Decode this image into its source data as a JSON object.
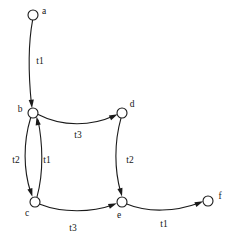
{
  "figure": {
    "kind": "directed-graph",
    "background_color": "#ffffff",
    "stroke_color": "#1a1a1a",
    "text_color": "#151515",
    "width": 237,
    "height": 244
  },
  "nodes": [
    {
      "id": "a",
      "label": "a",
      "cx": 33,
      "cy": 15,
      "r": 5,
      "label_x": 44,
      "label_y": 12
    },
    {
      "id": "b",
      "label": "b",
      "cx": 33,
      "cy": 113,
      "r": 5,
      "label_x": 20,
      "label_y": 110
    },
    {
      "id": "c",
      "label": "c",
      "cx": 35,
      "cy": 202,
      "r": 5,
      "label_x": 27,
      "label_y": 214
    },
    {
      "id": "d",
      "label": "d",
      "cx": 122,
      "cy": 113,
      "r": 5,
      "label_x": 132,
      "label_y": 105
    },
    {
      "id": "e",
      "label": "e",
      "cx": 122,
      "cy": 202,
      "r": 5,
      "label_x": 119,
      "label_y": 216
    },
    {
      "id": "f",
      "label": "f",
      "cx": 208,
      "cy": 201,
      "r": 5,
      "label_x": 220,
      "label_y": 197
    }
  ],
  "edges": [
    {
      "id": "a-b",
      "from": "a",
      "to": "b",
      "label": "t1",
      "label_x": 40,
      "label_y": 62,
      "path": "M 32.6 20.2 C 28.0 45.0 28.4 74.0 31.4 104.0",
      "arrow_tip": {
        "x": 32.0,
        "y": 108.2
      },
      "arrow_angle": 85
    },
    {
      "id": "b-d",
      "from": "b",
      "to": "d",
      "label": "t3",
      "label_x": 78,
      "label_y": 136,
      "path": "M 38.2 114.5 C 62.0 127.0 92.0 126.0 113.5 116.0",
      "arrow_tip": {
        "x": 117.6,
        "y": 114.2
      },
      "arrow_angle": -26
    },
    {
      "id": "b-c",
      "from": "b",
      "to": "c",
      "label": "t2",
      "label_x": 16,
      "label_y": 161,
      "path": "M 30.6 118.0 C 23.0 143.0 23.5 170.0 30.6 192.0",
      "arrow_tip": {
        "x": 32.4,
        "y": 196.8
      },
      "arrow_angle": 73
    },
    {
      "id": "c-b",
      "from": "c",
      "to": "b",
      "label": "t1",
      "label_x": 47,
      "label_y": 161,
      "path": "M 37.0 196.8 C 44.0 172.0 42.5 142.0 38.0 120.0",
      "arrow_tip": {
        "x": 36.6,
        "y": 116.6
      },
      "arrow_angle": -101
    },
    {
      "id": "d-e",
      "from": "d",
      "to": "e",
      "label": "t2",
      "label_x": 130,
      "label_y": 161,
      "path": "M 121.0 118.2 C 114.0 143.0 114.5 170.0 120.6 191.8",
      "arrow_tip": {
        "x": 122.0,
        "y": 196.6
      },
      "arrow_angle": 76
    },
    {
      "id": "c-e",
      "from": "c",
      "to": "e",
      "label": "t3",
      "label_x": 73,
      "label_y": 229,
      "path": "M 40.0 204.2 C 62.0 213.0 92.0 212.5 112.5 205.0",
      "arrow_tip": {
        "x": 116.8,
        "y": 203.2
      },
      "arrow_angle": -22
    },
    {
      "id": "e-f",
      "from": "e",
      "to": "f",
      "label": "t1",
      "label_x": 164,
      "label_y": 225,
      "path": "M 126.8 204.0 C 148.0 213.0 176.0 211.5 199.0 203.0",
      "arrow_tip": {
        "x": 203.2,
        "y": 201.2
      },
      "arrow_angle": -23
    }
  ]
}
